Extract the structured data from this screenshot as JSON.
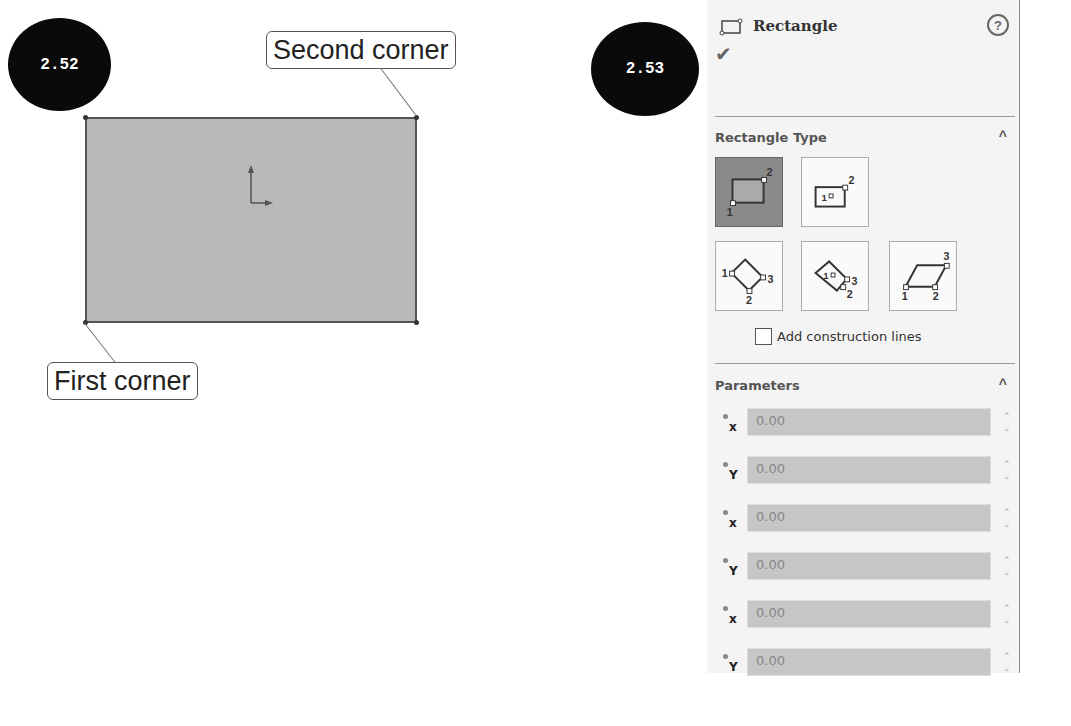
{
  "caption_partial": "p… the rectangle display in the … wizard …",
  "figure_left": {
    "badge": "2.52",
    "callout_second": "Second corner",
    "callout_first": "First corner"
  },
  "figure_right": {
    "badge": "2.53",
    "panel": {
      "title": "Rectangle",
      "help_icon": "?",
      "ok_icon": "✔",
      "rectangle_type": {
        "title": "Rectangle Type",
        "types": [
          "corner-rectangle",
          "center-rectangle",
          "3-point-corner-rectangle",
          "3-point-center-rectangle",
          "parallelogram"
        ],
        "selected": "corner-rectangle",
        "add_construction_lines": "Add construction lines"
      },
      "parameters": {
        "title": "Parameters",
        "rows": [
          {
            "axis": "x",
            "value": "0.00"
          },
          {
            "axis": "Y",
            "value": "0.00"
          },
          {
            "axis": "x",
            "value": "0.00"
          },
          {
            "axis": "Y",
            "value": "0.00"
          },
          {
            "axis": "x",
            "value": "0.00"
          },
          {
            "axis": "Y",
            "value": "0.00"
          }
        ]
      }
    }
  }
}
